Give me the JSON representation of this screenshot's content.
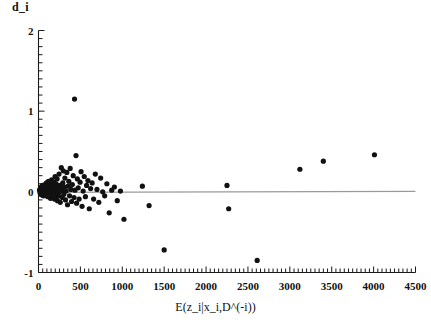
{
  "figure": {
    "title": "",
    "y_axis_label": "d_i",
    "x_axis_label": "E(z_i|x_i,D^(-i))"
  },
  "chart_data": {
    "type": "scatter",
    "title": "",
    "xlabel": "E(z_i|x_i,D^(-i))",
    "ylabel": "d_i",
    "xlim": [
      0,
      4500
    ],
    "ylim": [
      -1,
      2
    ],
    "xticks": [
      0,
      500,
      1000,
      1500,
      2000,
      2500,
      3000,
      3500,
      4000,
      4500
    ],
    "xtick_labels": [
      "0",
      "500",
      "1000",
      "1500",
      "2000",
      "2500",
      "3000",
      "3500",
      "4000",
      "4500"
    ],
    "yticks": [
      -1,
      0,
      1,
      2
    ],
    "ytick_labels": [
      "-1",
      "0",
      "1",
      "2"
    ],
    "x_minor_tick_step": 50,
    "y_minor_tick_step": 0.1,
    "grid": false,
    "legend": null,
    "marker": "filled-circle",
    "marker_color": "#111111",
    "marker_size_px": 3.4,
    "reference_line": {
      "y": 0,
      "color": "#9a9a9a",
      "width_px": 1.4,
      "x_from": 0,
      "x_to": 4500
    },
    "points": [
      [
        12,
        0.02
      ],
      [
        18,
        -0.01
      ],
      [
        22,
        0.04
      ],
      [
        25,
        0.0
      ],
      [
        28,
        -0.03
      ],
      [
        30,
        0.06
      ],
      [
        33,
        0.02
      ],
      [
        35,
        -0.02
      ],
      [
        38,
        0.05
      ],
      [
        40,
        0.01
      ],
      [
        42,
        -0.04
      ],
      [
        45,
        0.03
      ],
      [
        47,
        0.08
      ],
      [
        50,
        0.0
      ],
      [
        52,
        -0.02
      ],
      [
        55,
        0.04
      ],
      [
        58,
        0.02
      ],
      [
        60,
        -0.05
      ],
      [
        62,
        0.07
      ],
      [
        65,
        0.01
      ],
      [
        68,
        -0.01
      ],
      [
        70,
        0.05
      ],
      [
        72,
        0.03
      ],
      [
        75,
        -0.03
      ],
      [
        78,
        0.09
      ],
      [
        80,
        0.02
      ],
      [
        82,
        -0.02
      ],
      [
        85,
        0.06
      ],
      [
        88,
        0.0
      ],
      [
        90,
        0.04
      ],
      [
        92,
        -0.04
      ],
      [
        95,
        0.11
      ],
      [
        98,
        0.01
      ],
      [
        100,
        -0.01
      ],
      [
        103,
        0.07
      ],
      [
        106,
        0.03
      ],
      [
        110,
        -0.06
      ],
      [
        112,
        0.05
      ],
      [
        115,
        0.02
      ],
      [
        118,
        0.13
      ],
      [
        120,
        -0.02
      ],
      [
        124,
        0.08
      ],
      [
        127,
        0.0
      ],
      [
        130,
        -0.05
      ],
      [
        133,
        0.04
      ],
      [
        136,
        0.1
      ],
      [
        140,
        0.02
      ],
      [
        143,
        -0.08
      ],
      [
        146,
        0.06
      ],
      [
        150,
        0.01
      ],
      [
        153,
        -0.03
      ],
      [
        157,
        0.15
      ],
      [
        160,
        0.03
      ],
      [
        163,
        -0.07
      ],
      [
        167,
        0.09
      ],
      [
        170,
        0.0
      ],
      [
        174,
        0.05
      ],
      [
        178,
        -0.04
      ],
      [
        182,
        0.12
      ],
      [
        186,
        0.02
      ],
      [
        190,
        -0.09
      ],
      [
        194,
        0.07
      ],
      [
        198,
        0.19
      ],
      [
        202,
        -0.02
      ],
      [
        206,
        0.04
      ],
      [
        210,
        0.1
      ],
      [
        214,
        -0.06
      ],
      [
        218,
        0.01
      ],
      [
        222,
        0.16
      ],
      [
        226,
        -0.11
      ],
      [
        230,
        0.06
      ],
      [
        235,
        0.03
      ],
      [
        240,
        -0.05
      ],
      [
        245,
        0.22
      ],
      [
        250,
        0.0
      ],
      [
        255,
        0.08
      ],
      [
        260,
        -0.13
      ],
      [
        266,
        0.05
      ],
      [
        272,
        0.3
      ],
      [
        278,
        0.02
      ],
      [
        284,
        -0.07
      ],
      [
        290,
        0.11
      ],
      [
        296,
        0.26
      ],
      [
        302,
        -0.03
      ],
      [
        308,
        0.06
      ],
      [
        315,
        0.17
      ],
      [
        322,
        -0.1
      ],
      [
        330,
        0.01
      ],
      [
        338,
        0.24
      ],
      [
        346,
        -0.16
      ],
      [
        354,
        0.07
      ],
      [
        362,
        0.13
      ],
      [
        370,
        -0.05
      ],
      [
        378,
        0.29
      ],
      [
        386,
        0.03
      ],
      [
        395,
        -0.12
      ],
      [
        404,
        0.09
      ],
      [
        414,
        0.2
      ],
      [
        424,
        -0.07
      ],
      [
        430,
        1.15
      ],
      [
        436,
        0.02
      ],
      [
        448,
        0.45
      ],
      [
        455,
        -0.14
      ],
      [
        464,
        0.16
      ],
      [
        474,
        0.05
      ],
      [
        485,
        -0.09
      ],
      [
        496,
        0.12
      ],
      [
        508,
        0.25
      ],
      [
        520,
        -0.18
      ],
      [
        533,
        0.01
      ],
      [
        546,
        0.19
      ],
      [
        560,
        -0.06
      ],
      [
        574,
        0.08
      ],
      [
        590,
        0.14
      ],
      [
        606,
        -0.21
      ],
      [
        622,
        0.04
      ],
      [
        640,
        0.11
      ],
      [
        658,
        -0.09
      ],
      [
        678,
        0.22
      ],
      [
        698,
        0.03
      ],
      [
        720,
        -0.13
      ],
      [
        742,
        0.17
      ],
      [
        766,
        0.0
      ],
      [
        790,
        -0.05
      ],
      [
        816,
        0.1
      ],
      [
        844,
        -0.26
      ],
      [
        874,
        0.02
      ],
      [
        906,
        0.06
      ],
      [
        940,
        -0.11
      ],
      [
        978,
        0.01
      ],
      [
        1020,
        -0.34
      ],
      [
        1240,
        0.07
      ],
      [
        1320,
        -0.17
      ],
      [
        1500,
        -0.72
      ],
      [
        2250,
        0.08
      ],
      [
        2270,
        -0.21
      ],
      [
        2610,
        -0.85
      ],
      [
        3120,
        0.28
      ],
      [
        3400,
        0.38
      ],
      [
        4010,
        0.46
      ]
    ]
  }
}
